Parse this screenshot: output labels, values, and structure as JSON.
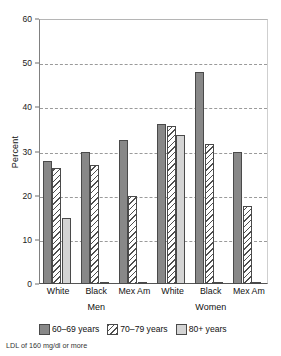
{
  "chart_data": {
    "type": "bar",
    "title": "",
    "xlabel": "",
    "ylabel": "Percent",
    "ylim": [
      0,
      60
    ],
    "yticks": [
      0,
      10,
      20,
      30,
      40,
      50,
      60
    ],
    "ytick_labels": [
      "0",
      "10",
      "20",
      "30",
      "40",
      "50",
      "60"
    ],
    "grid": true,
    "grid_style": "dashed horizontal",
    "legend_position": "below-axes",
    "categories": [
      "White",
      "Black",
      "Mex Am",
      "White",
      "Black",
      "Mex Am"
    ],
    "group_labels": [
      "Men",
      "Women"
    ],
    "groups": [
      {
        "name": "Men",
        "categories": [
          "White",
          "Black",
          "Mex Am"
        ],
        "values": [
          [
            27.8,
            26.3,
            15.0
          ],
          [
            30.0,
            27.0,
            0.2
          ],
          [
            32.6,
            19.9,
            0.2
          ]
        ]
      },
      {
        "name": "Women",
        "categories": [
          "White",
          "Black",
          "Mex Am"
        ],
        "values": [
          [
            36.2,
            35.8,
            33.8
          ],
          [
            48.0,
            31.8,
            0.2
          ],
          [
            30.0,
            17.6,
            0.2
          ]
        ]
      }
    ],
    "series": [
      {
        "name": "60-69 years",
        "label": "60–69 years",
        "color": "#888888",
        "pattern": "solid",
        "values": [
          27.8,
          30.0,
          32.6,
          36.2,
          48.0,
          30.0
        ]
      },
      {
        "name": "70-79 years",
        "label": "70–79 years",
        "color": "#ffffff",
        "pattern": "diagonal-hatch",
        "values": [
          26.3,
          27.0,
          19.9,
          35.8,
          31.8,
          17.6
        ]
      },
      {
        "name": "80+ years",
        "label": "80+ years",
        "color": "#d4d4d4",
        "pattern": "solid",
        "values": [
          15.0,
          0.2,
          0.2,
          33.8,
          0.2,
          0.2
        ]
      }
    ],
    "footnote": "LDL of 160 mg/dl or more"
  },
  "axes": {
    "y_title": "Percent"
  },
  "colors": {
    "series_60_69": "#888888",
    "series_70_79": "#ffffff",
    "series_80_plus": "#d4d4d4",
    "bar_outline": "#4a4a4a",
    "gridline": "#9a9a9a",
    "axis": "#808080"
  }
}
